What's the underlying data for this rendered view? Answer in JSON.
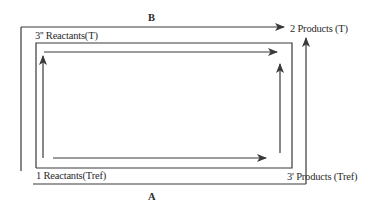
{
  "diagram": {
    "type": "thermodynamic-cycle",
    "stroke_color": "#3a3a3a",
    "background": "#ffffff",
    "states": {
      "state1": {
        "label": "1 Reactants(Tref)",
        "position": "bottom-left"
      },
      "state2": {
        "label": "2 Products (T)",
        "position": "top-right"
      },
      "state3pp": {
        "label": "3'' Reactants(T)",
        "position": "top-left"
      },
      "state3p": {
        "label": "3' Products (Tref)",
        "position": "bottom-right"
      }
    },
    "paths": {
      "A": {
        "label": "A",
        "position": "bottom",
        "description": "1 → 3' (along bottom) then 3' → 2 (up right side)"
      },
      "B": {
        "label": "B",
        "position": "top",
        "description": "1 → 3'' (up left side) then 3'' → 2 (along top)"
      }
    }
  }
}
